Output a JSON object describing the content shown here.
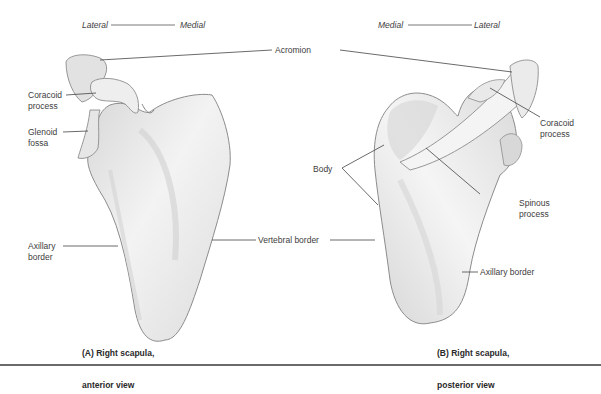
{
  "figure": {
    "panel_a": {
      "orientation": {
        "left": "Lateral",
        "right": "Medial"
      },
      "labels": {
        "coracoid": [
          "Coracoid",
          "process"
        ],
        "glenoid": [
          "Glenoid",
          "fossa"
        ],
        "axillary": [
          "Axillary",
          "border"
        ]
      },
      "caption": [
        "(A) Right scapula,",
        "anterior view"
      ]
    },
    "panel_b": {
      "orientation": {
        "left": "Medial",
        "right": "Lateral"
      },
      "labels": {
        "coracoid": [
          "Coracoid",
          "process"
        ],
        "body": "Body",
        "spinous": [
          "Spinous",
          "process"
        ],
        "axillary": "Axillary border"
      },
      "caption": [
        "(B) Right scapula,",
        "posterior view"
      ]
    },
    "shared_labels": {
      "acromion": "Acromion",
      "vertebral_border": "Vertebral border"
    },
    "colors": {
      "bone_fill": "#ececec",
      "bone_shade": "#c9c9c9",
      "outline": "#8c8c8c",
      "leader": "#444444",
      "rule": "#6a6a6a"
    }
  }
}
